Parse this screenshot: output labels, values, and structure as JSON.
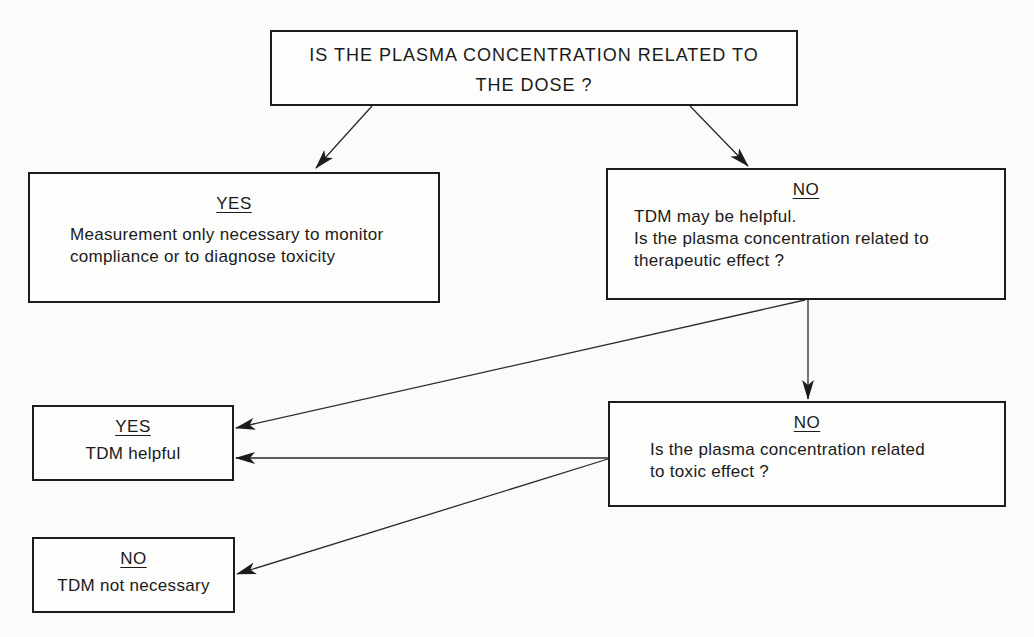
{
  "diagram": {
    "root": {
      "line1": "IS THE PLASMA CONCENTRATION RELATED TO",
      "line2": "THE DOSE ?"
    },
    "yes_dose": {
      "heading": "YES",
      "line1": "Measurement only necessary to monitor",
      "line2": "compliance or to diagnose toxicity"
    },
    "no_dose": {
      "heading": "NO",
      "line1": "TDM may be helpful.",
      "line2": "Is the plasma concentration related to",
      "line3": "therapeutic effect ?"
    },
    "no_therapeutic": {
      "heading": "NO",
      "line1": "Is the plasma concentration related",
      "line2": "to toxic effect ?"
    },
    "yes_helpful": {
      "heading": "YES",
      "text": "TDM helpful"
    },
    "no_necessary": {
      "heading": "NO",
      "text": "TDM not necessary"
    },
    "edges": [
      {
        "from": "root",
        "to": "yes_dose"
      },
      {
        "from": "root",
        "to": "no_dose"
      },
      {
        "from": "no_dose",
        "to": "yes_helpful"
      },
      {
        "from": "no_dose",
        "to": "no_therapeutic"
      },
      {
        "from": "no_therapeutic",
        "to": "yes_helpful"
      },
      {
        "from": "no_therapeutic",
        "to": "no_necessary"
      }
    ]
  }
}
